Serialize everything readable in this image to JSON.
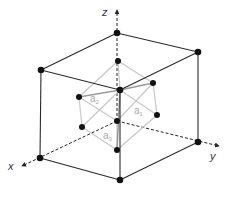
{
  "diagram": {
    "type": "fcc-unit-cell-primitive-vectors",
    "axes": {
      "x": {
        "label": "x"
      },
      "y": {
        "label": "y"
      },
      "z": {
        "label": "z"
      }
    },
    "vectors": [
      {
        "name": "a",
        "sub": "1"
      },
      {
        "name": "a",
        "sub": "2"
      },
      {
        "name": "a",
        "sub": "3"
      }
    ],
    "colors": {
      "cube_edge": "#2a2a2a",
      "primitive_edge": "#c8c8c8",
      "atom": "#111111",
      "axis": "#222222",
      "label": "#a8a8a8"
    }
  }
}
